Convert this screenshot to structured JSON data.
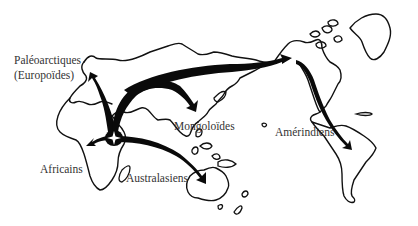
{
  "figure": {
    "type": "migration-map",
    "colors": {
      "background": "#ffffff",
      "coastline": "#111111",
      "routes": "#0a0a0a",
      "labels": "#333333"
    },
    "origin_marker": "four-point-star-icon"
  },
  "labels": {
    "paleoarctiques_line1": "Paléoarctiques",
    "paleoarctiques_line2": "(Europoïdes)",
    "mongoloides": "Mongoloïdes",
    "amerindiens": "Amérindiens",
    "africains": "Africains",
    "australasiens": "Australasiens"
  },
  "routes": [
    {
      "from": "East Africa",
      "to": "Europe",
      "population": "Paléoarctiques (Europoïdes)"
    },
    {
      "from": "East Africa",
      "to": "East Asia",
      "population": "Mongoloïdes"
    },
    {
      "from": "East Asia",
      "to": "Bering Strait",
      "population": "Amérindiens"
    },
    {
      "from": "North America",
      "to": "South America",
      "population": "Amérindiens"
    },
    {
      "from": "East Africa",
      "to": "Africa (west/south)",
      "population": "Africains"
    },
    {
      "from": "East Africa",
      "to": "Australia",
      "population": "Australasiens"
    }
  ]
}
